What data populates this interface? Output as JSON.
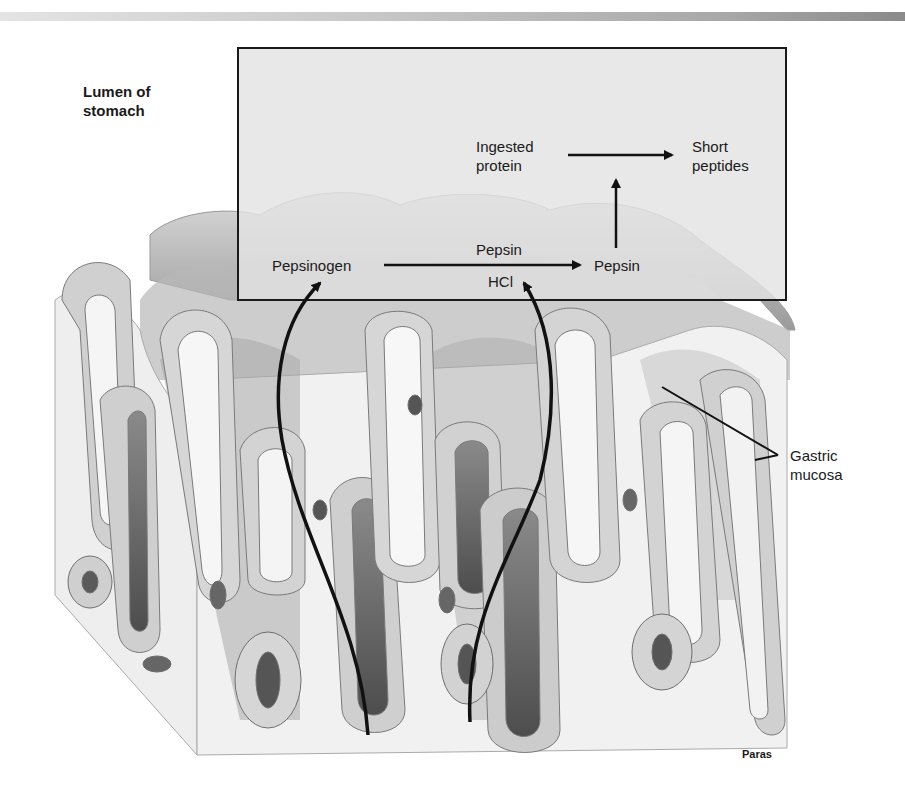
{
  "figure": {
    "lumen_label": [
      "Lumen of",
      "stomach"
    ],
    "ingested_protein_label": [
      "Ingested",
      "protein"
    ],
    "short_peptides_label": [
      "Short",
      "peptides"
    ],
    "pepsinogen_label": "Pepsinogen",
    "pepsin_catalyst_label": "Pepsin",
    "hcl_label": "HCl",
    "pepsin_product_label": "Pepsin",
    "gastric_mucosa_label": [
      "Gastric",
      "mucosa"
    ],
    "artist_credit": "Paras"
  },
  "colors": {
    "box_fill": "#e3e3e3",
    "box_border": "#1a1a1a",
    "tissue_light": "#f2f2f2",
    "tissue_mid": "#bdbdbd",
    "tissue_dark": "#6e6e6e",
    "arrow": "#111111"
  }
}
